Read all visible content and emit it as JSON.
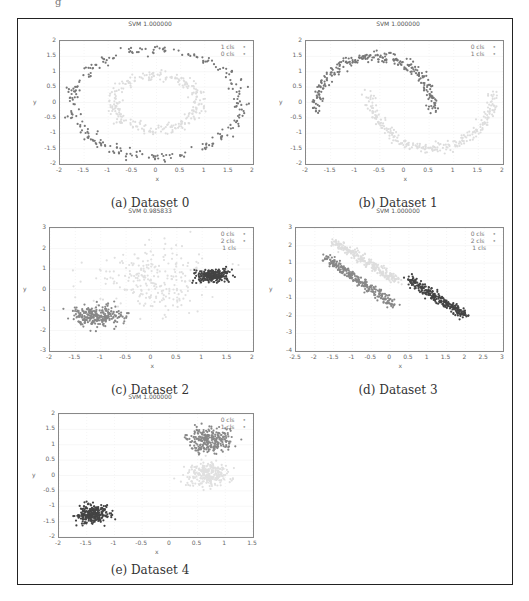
{
  "figure": {
    "panels": [
      {
        "id": "a",
        "title": "SVM 1.000000",
        "caption": "(a) Dataset 0",
        "legend": [
          "1 cls",
          "0 cls"
        ],
        "xticks": [
          "-2",
          "-1.5",
          "-1",
          "-0.5",
          "0",
          "0.5",
          "1",
          "1.5",
          "2"
        ],
        "yticks": [
          "2",
          "1.5",
          "1",
          "0.5",
          "0",
          "-0.5",
          "-1",
          "-1.5",
          "-2"
        ],
        "xlabel": "x",
        "ylabel": "y"
      },
      {
        "id": "b",
        "title": "SVM 1.000000",
        "caption": "(b) Dataset 1",
        "legend": [
          "0 cls",
          "1 cls"
        ],
        "xticks": [
          "-2",
          "-1.5",
          "-1",
          "-0.5",
          "0",
          "0.5",
          "1",
          "1.5",
          "2"
        ],
        "yticks": [
          "2",
          "1.5",
          "1",
          "0.5",
          "0",
          "-0.5",
          "-1",
          "-1.5",
          "-2"
        ],
        "xlabel": "x",
        "ylabel": "y"
      },
      {
        "id": "c",
        "title": "SVM 0.985833",
        "caption": "(c) Dataset 2",
        "legend": [
          "0 cls",
          "2 cls",
          "1 cls"
        ],
        "xticks": [
          "-2",
          "-1.5",
          "-1",
          "-0.5",
          "0",
          "0.5",
          "1",
          "1.5",
          "2"
        ],
        "yticks": [
          "3",
          "2",
          "1",
          "0",
          "-1",
          "-2",
          "-3"
        ],
        "xlabel": "x",
        "ylabel": "y"
      },
      {
        "id": "d",
        "title": "SVM 1.000000",
        "caption": "(d) Dataset 3",
        "legend": [
          "0 cls",
          "2 cls",
          "1 cls"
        ],
        "xticks": [
          "-2.5",
          "-2",
          "-1.5",
          "-1",
          "-0.5",
          "0",
          "0.5",
          "1",
          "1.5",
          "2",
          "2.5",
          "3"
        ],
        "yticks": [
          "3",
          "2",
          "1",
          "0",
          "-1",
          "-2",
          "-3",
          "-4"
        ],
        "xlabel": "x",
        "ylabel": "y"
      },
      {
        "id": "e",
        "title": "SVM 1.000000",
        "caption": "(e) Dataset 4",
        "legend": [
          "0 cls",
          "1 cls"
        ],
        "xticks": [
          "-2",
          "-1.5",
          "-1",
          "-0.5",
          "0",
          "0.5",
          "1",
          "1.5"
        ],
        "yticks": [
          "2",
          "1.5",
          "1",
          "0.5",
          "0",
          "-0.5",
          "-1",
          "-1.5",
          "-2"
        ],
        "xlabel": "x",
        "ylabel": "y"
      }
    ]
  },
  "chart_data": [
    {
      "type": "scatter",
      "title": "SVM 1.000000",
      "caption": "(a) Dataset 0",
      "xlabel": "x",
      "ylabel": "y",
      "xlim": [
        -2,
        2
      ],
      "ylim": [
        -2,
        2
      ],
      "grid": true,
      "legend_position": "upper right",
      "series": [
        {
          "name": "outer ring (dark)",
          "shape": "ring",
          "center": [
            0,
            0
          ],
          "radius": 1.75,
          "color": "#777777"
        },
        {
          "name": "inner ring (light)",
          "shape": "ring",
          "center": [
            0,
            0
          ],
          "radius": 0.9,
          "color": "#dddddd"
        }
      ]
    },
    {
      "type": "scatter",
      "title": "SVM 1.000000",
      "caption": "(b) Dataset 1",
      "xlabel": "x",
      "ylabel": "y",
      "xlim": [
        -2,
        2
      ],
      "ylim": [
        -2,
        2
      ],
      "grid": true,
      "legend_position": "upper right",
      "series": [
        {
          "name": "upper moon (dark)",
          "shape": "arc",
          "x_range": [
            -1.8,
            0.6
          ],
          "peak_y": 1.5,
          "color": "#777777"
        },
        {
          "name": "lower moon (light)",
          "shape": "arc",
          "x_range": [
            -0.7,
            1.8
          ],
          "trough_y": -1.5,
          "color": "#dddddd"
        }
      ]
    },
    {
      "type": "scatter",
      "title": "SVM 0.985833",
      "caption": "(c) Dataset 2",
      "xlabel": "x",
      "ylabel": "y",
      "xlim": [
        -2,
        2
      ],
      "ylim": [
        -3,
        3
      ],
      "grid": true,
      "legend_position": "upper right",
      "series": [
        {
          "name": "0 cls",
          "center": [
            0,
            0.5
          ],
          "spread": 0.6,
          "color": "#e0e0e0"
        },
        {
          "name": "2 cls",
          "center": [
            1.2,
            0.7
          ],
          "spread": 0.15,
          "color": "#444444"
        },
        {
          "name": "1 cls",
          "center": [
            -1.05,
            -1.3
          ],
          "spread": 0.25,
          "color": "#888888"
        }
      ]
    },
    {
      "type": "scatter",
      "title": "SVM 1.000000",
      "caption": "(d) Dataset 3",
      "xlabel": "x",
      "ylabel": "y",
      "xlim": [
        -2.5,
        3
      ],
      "ylim": [
        -4,
        3
      ],
      "grid": true,
      "legend_position": "upper right",
      "series": [
        {
          "name": "0 cls",
          "line": [
            [
              -1.5,
              2.2
            ],
            [
              0.2,
              0
            ]
          ],
          "color": "#dddddd"
        },
        {
          "name": "2 cls",
          "line": [
            [
              0.5,
              0.1
            ],
            [
              2,
              -2
            ]
          ],
          "color": "#444444"
        },
        {
          "name": "1 cls",
          "line": [
            [
              -1.7,
              1.3
            ],
            [
              0.1,
              -1.4
            ]
          ],
          "color": "#888888"
        }
      ]
    },
    {
      "type": "scatter",
      "title": "SVM 1.000000",
      "caption": "(e) Dataset 4",
      "xlabel": "x",
      "ylabel": "y",
      "xlim": [
        -2,
        1.5
      ],
      "ylim": [
        -2,
        2
      ],
      "grid": true,
      "legend_position": "upper right",
      "series": [
        {
          "name": "upper cluster (mid)",
          "center": [
            0.7,
            1.15
          ],
          "spread": 0.2,
          "color": "#888888"
        },
        {
          "name": "middle cluster (light)",
          "center": [
            0.7,
            0.05
          ],
          "spread": 0.2,
          "color": "#e0e0e0"
        },
        {
          "name": "lower cluster (dark)",
          "center": [
            -1.4,
            -1.25
          ],
          "spread": 0.15,
          "color": "#444444"
        }
      ]
    }
  ]
}
